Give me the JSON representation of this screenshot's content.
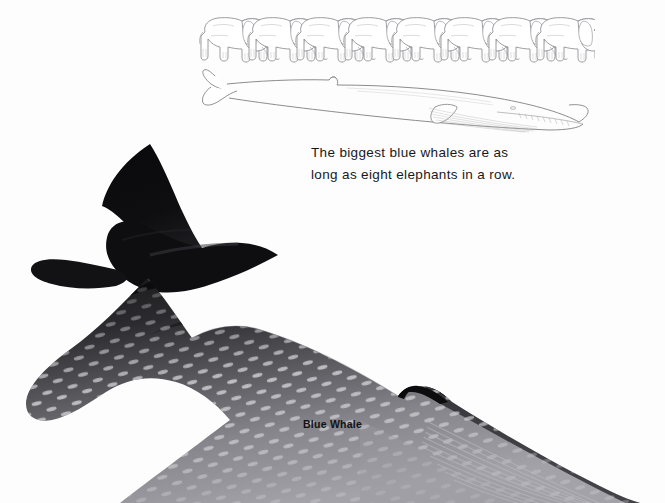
{
  "page": {
    "background_color": "#fdfdfd",
    "kind": "illustrated-book-page"
  },
  "caption": {
    "line1": "The biggest blue whales are as",
    "line2": "long as eight elephants in a row.",
    "text_color": "#18181a"
  },
  "species_label": {
    "text": "Blue Whale",
    "color": "#121214"
  },
  "comparison": {
    "elephant_count": 8,
    "elephant_icon": "elephant-line-art-icon",
    "outline_whale_icon": "blue-whale-outline-icon",
    "line_color": "#8a8a8e"
  },
  "big_whale": {
    "icon": "blue-whale-illustration",
    "body_color": "#131316",
    "belly_color": "#8e8e92",
    "speckle_color": "#c9c9cc",
    "parts": [
      "tail-fluke",
      "caudal-peduncle",
      "dorsal-fin",
      "body",
      "ventral-pleats"
    ]
  }
}
